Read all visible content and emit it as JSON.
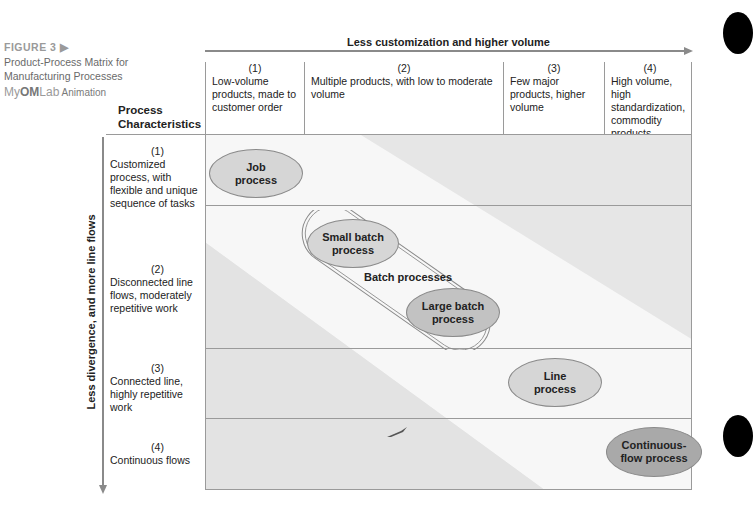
{
  "caption": {
    "figure_label": "FIGURE 3",
    "figure_marker": "▶",
    "title": "Product-Process Matrix for Manufacturing Processes",
    "brand_my": "My",
    "brand_om": "OM",
    "brand_lab": "Lab",
    "animation": "Animation"
  },
  "row_header_title": "Process Characteristics",
  "horizontal_axis": {
    "label": "Less customization and higher volume"
  },
  "vertical_axis": {
    "label": "Less divergence, and more line flows"
  },
  "columns": [
    {
      "num": "(1)",
      "text": "Low-volume products, made to customer order"
    },
    {
      "num": "(2)",
      "text": "Multiple products, with low to moderate volume"
    },
    {
      "num": "(3)",
      "text": "Few major products, higher volume"
    },
    {
      "num": "(4)",
      "text": "High volume, high standardization, commodity products"
    }
  ],
  "rows": [
    {
      "num": "(1)",
      "text": "Customized process, with flexible and unique sequence of tasks"
    },
    {
      "num": "(2)",
      "text": "Disconnected line flows, moderately repetitive work"
    },
    {
      "num": "(3)",
      "text": "Connected line, highly repetitive work"
    },
    {
      "num": "(4)",
      "text": "Continuous flows"
    }
  ],
  "processes": {
    "job": "Job process",
    "small_batch": "Small batch process",
    "batch_group": "Batch processes",
    "large_batch": "Large batch process",
    "line": "Line process",
    "continuous": "Continuous-flow process"
  },
  "colors": {
    "band_white": "#f7f7f7",
    "band_gray": "#e6e6e6",
    "ellipse_light": "#d6d6d6",
    "ellipse_mid": "#c2c2c2",
    "ellipse_dark": "#a9a9a9",
    "arrow": "#8a8a8a"
  }
}
